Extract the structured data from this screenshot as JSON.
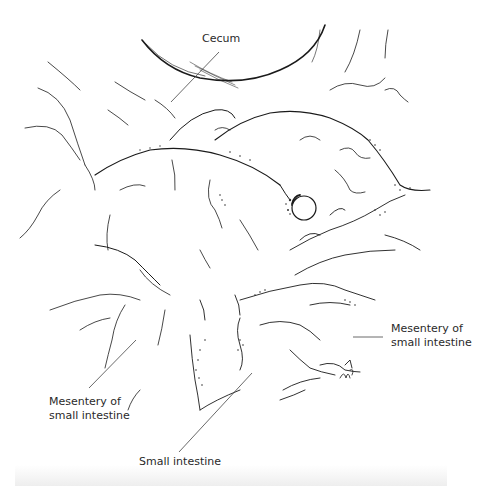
{
  "figure": {
    "labels": {
      "cecum": "Cecum",
      "mesentery_right_line1": "Mesentery of",
      "mesentery_right_line2": "small intestine",
      "mesentery_left_line1": "Mesentery of",
      "mesentery_left_line2": "small intestine",
      "small_intestine": "Small intestine"
    },
    "signature": "MS",
    "colors": {
      "line": "#1a1a1a",
      "stipple": "#333333",
      "leader": "#444444",
      "background": "#ffffff"
    }
  }
}
